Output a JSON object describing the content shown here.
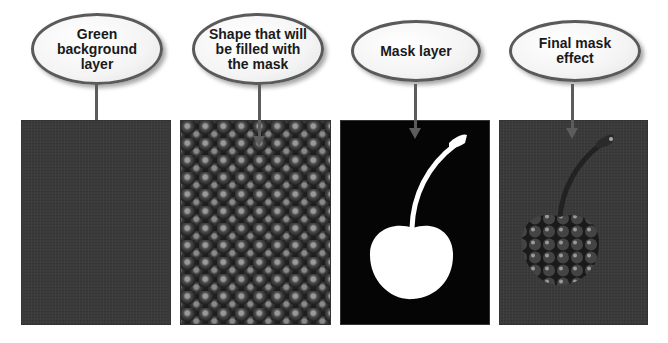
{
  "diagram": {
    "steps": [
      {
        "label": "Green\nbackground\nlayer",
        "panel": "green-background"
      },
      {
        "label": "Shape that will\nbe filled with\nthe mask",
        "panel": "cherry-texture"
      },
      {
        "label": "Mask layer",
        "panel": "cherry-silhouette-mask"
      },
      {
        "label": "Final mask\neffect",
        "panel": "masked-cherry-result"
      }
    ]
  },
  "colors": {
    "bubble_border": "#5a5a5a",
    "arrow": "#5c5c5c",
    "green_layer": "#3a3a3a",
    "mask_black": "#050505",
    "mask_white": "#ffffff"
  }
}
